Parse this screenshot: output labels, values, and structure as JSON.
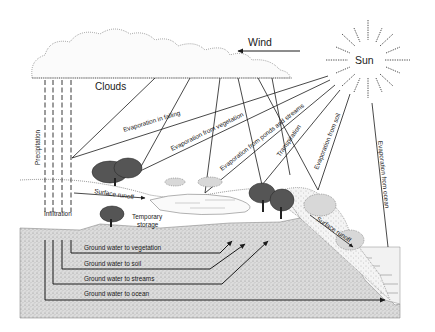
{
  "diagram": {
    "labels": {
      "wind": "Wind",
      "sun": "Sun",
      "clouds": "Clouds",
      "precipitation": "Precipitation",
      "infiltration": "Infiltration",
      "surface_runoff_left": "Surface runoff",
      "surface_runoff_right": "Surface runoff",
      "temporary_storage_line1": "Temporary",
      "temporary_storage_line2": "storage",
      "evaporation_in_falling": "Evaporation in falling",
      "evaporation_from_vegetation": "Evaporation from vegetation",
      "evaporation_from_ponds": "Evaporation from ponds and streams",
      "transpiration": "Transpiration",
      "evaporation_from_soil": "Evaporation from soil",
      "evaporation_from_ocean": "Evaporation from ocean",
      "gw_vegetation": "Ground water to vegetation",
      "gw_soil": "Ground water to soil",
      "gw_streams": "Ground water to streams",
      "gw_ocean": "Ground water to ocean"
    },
    "colors": {
      "ink": "#1a1a1a",
      "ground": "#d6d6d6",
      "paper": "#ffffff"
    }
  }
}
